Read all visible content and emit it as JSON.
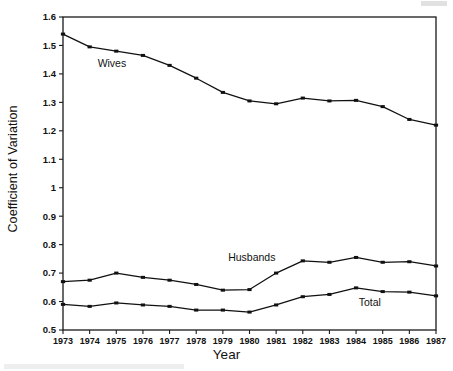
{
  "figure": {
    "ylabel": "Coefficient of Variation",
    "xlabel": "Year"
  },
  "chart_data": {
    "type": "line",
    "title": "",
    "subtitle": "",
    "xlabel": "Year",
    "ylabel": "Coefficient of Variation",
    "categories": [
      "1973",
      "1974",
      "1975",
      "1976",
      "1977",
      "1978",
      "1979",
      "1980",
      "1981",
      "1982",
      "1983",
      "1984",
      "1985",
      "1986",
      "1987"
    ],
    "x": [
      1973,
      1974,
      1975,
      1976,
      1977,
      1978,
      1979,
      1980,
      1981,
      1982,
      1983,
      1984,
      1985,
      1986,
      1987
    ],
    "xlim": [
      1973,
      1987
    ],
    "ylim": [
      0.5,
      1.6
    ],
    "yticks": [
      0.5,
      0.6,
      0.7,
      0.8,
      0.9,
      1,
      1.1,
      1.2,
      1.3,
      1.4,
      1.5,
      1.6
    ],
    "ytick_labels": [
      "0.5",
      "0.6",
      "0.7",
      "0.8",
      "0.9",
      "1",
      "1.1",
      "1.2",
      "1.3",
      "1.4",
      "1.5",
      "1.6"
    ],
    "grid": false,
    "legend": "inline-annotations",
    "marker": "square",
    "series": [
      {
        "name": "Wives",
        "label_x": 1974.3,
        "label_y": 1.425,
        "values": [
          1.54,
          1.495,
          1.48,
          1.465,
          1.43,
          1.385,
          1.335,
          1.305,
          1.295,
          1.315,
          1.305,
          1.307,
          1.285,
          1.24,
          1.22
        ]
      },
      {
        "name": "Husbands",
        "label_x": 1979.2,
        "label_y": 0.742,
        "values": [
          0.67,
          0.675,
          0.7,
          0.685,
          0.675,
          0.66,
          0.64,
          0.642,
          0.7,
          0.743,
          0.738,
          0.755,
          0.738,
          0.74,
          0.725
        ]
      },
      {
        "name": "Total",
        "label_x": 1984.1,
        "label_y": 0.585,
        "values": [
          0.59,
          0.583,
          0.595,
          0.588,
          0.583,
          0.57,
          0.57,
          0.563,
          0.588,
          0.617,
          0.625,
          0.648,
          0.635,
          0.633,
          0.62
        ]
      }
    ]
  }
}
